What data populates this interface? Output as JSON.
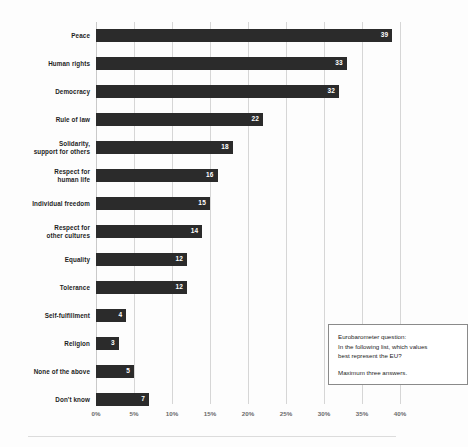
{
  "chart_data": {
    "type": "bar",
    "orientation": "horizontal",
    "title": "",
    "subtitle": "",
    "xlabel": "",
    "ylabel": "",
    "xlim": [
      0,
      40
    ],
    "grid": true,
    "legend": null,
    "value_suffix": "%",
    "categories": [
      "Peace",
      "Human rights",
      "Democracy",
      "Rule of law",
      "Solidarity, support for others",
      "Respect for human life",
      "Individual freedom",
      "Respect for other cultures",
      "Equality",
      "Tolerance",
      "Self-fulfillment",
      "Religion",
      "None of the above",
      "Don't know"
    ],
    "values": [
      39,
      33,
      32,
      22,
      18,
      16,
      15,
      14,
      12,
      12,
      4,
      3,
      5,
      7
    ],
    "xticks": [
      "0%",
      "5%",
      "10%",
      "15%",
      "20%",
      "25%",
      "30%",
      "35%",
      "40%"
    ],
    "xtick_values": [
      0,
      5,
      10,
      15,
      20,
      25,
      30,
      35,
      40
    ],
    "bar_color": "#2b2b2b",
    "value_label_color": "#ffffff",
    "gridline_color": "#d6d6d6"
  },
  "rows": [
    {
      "label_lines": [
        "Peace"
      ],
      "value": 39
    },
    {
      "label_lines": [
        "Human rights"
      ],
      "value": 33
    },
    {
      "label_lines": [
        "Democracy"
      ],
      "value": 32
    },
    {
      "label_lines": [
        "Rule of law"
      ],
      "value": 22
    },
    {
      "label_lines": [
        "Solidarity,",
        "support for others"
      ],
      "value": 18
    },
    {
      "label_lines": [
        "Respect for",
        "human life"
      ],
      "value": 16
    },
    {
      "label_lines": [
        "Individual freedom"
      ],
      "value": 15
    },
    {
      "label_lines": [
        "Respect for",
        "other cultures"
      ],
      "value": 14
    },
    {
      "label_lines": [
        "Equality"
      ],
      "value": 12
    },
    {
      "label_lines": [
        "Tolerance"
      ],
      "value": 12
    },
    {
      "label_lines": [
        "Self-fulfillment"
      ],
      "value": 4
    },
    {
      "label_lines": [
        "Religion"
      ],
      "value": 3
    },
    {
      "label_lines": [
        "None of the above"
      ],
      "value": 5
    },
    {
      "label_lines": [
        "Don't know"
      ],
      "value": 7
    }
  ],
  "annotation": {
    "line1": "Eurobarometer question:",
    "line2": "In the following list, which values",
    "line3": "best represent the EU?",
    "line4": "Maximum three answers."
  }
}
